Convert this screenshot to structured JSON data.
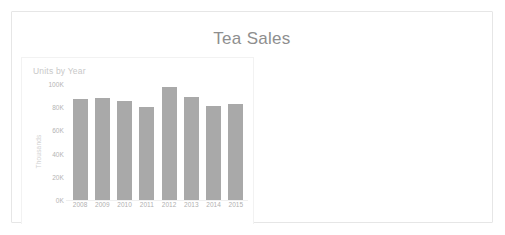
{
  "report": {
    "title": "Tea Sales"
  },
  "visual": {
    "header": "Units by Year"
  },
  "chart_data": {
    "type": "bar",
    "title": "Units by Year",
    "xlabel": "",
    "ylabel": "Thousands",
    "categories": [
      "2008",
      "2009",
      "2010",
      "2011",
      "2012",
      "2013",
      "2014",
      "2015"
    ],
    "values": [
      87000,
      88000,
      85000,
      80000,
      97000,
      89000,
      81000,
      83000
    ],
    "ylim": [
      0,
      100000
    ],
    "ytick_values": [
      0,
      20000,
      40000,
      60000,
      80000,
      100000
    ],
    "ytick_labels": [
      "0K",
      "20K",
      "40K",
      "60K",
      "80K",
      "100K"
    ],
    "grid": false,
    "legend": false,
    "bar_color": "#a9a9a9",
    "series": [
      {
        "name": "Units",
        "values": [
          87000,
          88000,
          85000,
          80000,
          97000,
          89000,
          81000,
          83000
        ]
      }
    ]
  },
  "colors": {
    "card_border": "#e6e6e6",
    "title_text": "#8e8e8e",
    "axis_text": "#b4b4b4",
    "bar": "#a9a9a9",
    "background": "#ffffff"
  }
}
